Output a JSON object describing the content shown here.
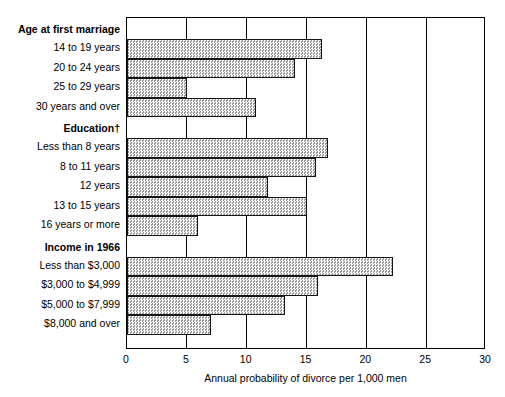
{
  "chart_data": {
    "type": "bar",
    "orientation": "horizontal",
    "title": "",
    "xlabel": "Annual probability of divorce per 1,000 men",
    "ylabel": "",
    "xlim": [
      0,
      30
    ],
    "xticks": [
      "0",
      "5",
      "10",
      "15",
      "20",
      "25",
      "30"
    ],
    "xtick_values": [
      0,
      5,
      10,
      15,
      20,
      25,
      30
    ],
    "grid": "vertical",
    "legend": "none",
    "bar_fill": "#cdcdcd",
    "bar_edge": "#151515",
    "groups": [
      {
        "header": "Age at first marriage",
        "categories": [
          "14 to 19 years",
          "20 to 24 years",
          "25 to 29 years",
          "30 years and over"
        ],
        "values": [
          16.3,
          14.0,
          5.0,
          10.8
        ]
      },
      {
        "header": "Education†",
        "categories": [
          "Less than 8 years",
          "8 to 11 years",
          "12 years",
          "13 to 15 years",
          "16 years or more"
        ],
        "values": [
          16.8,
          15.8,
          11.8,
          15.0,
          5.9
        ]
      },
      {
        "header": "Income in 1966",
        "categories": [
          "Less than $3,000",
          "$3,000 to $4,999",
          "$5,000 to $7,999",
          "$8,000 and over"
        ],
        "values": [
          22.2,
          16.0,
          13.2,
          7.0
        ]
      }
    ]
  }
}
